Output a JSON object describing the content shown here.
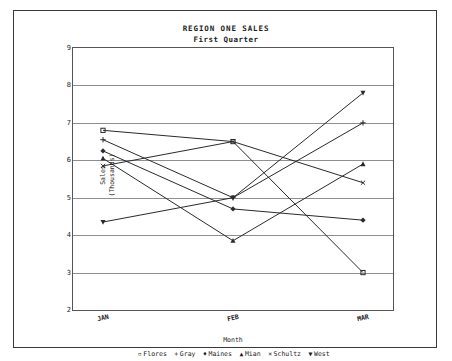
{
  "chart_data": {
    "type": "line",
    "title": "REGION ONE SALES",
    "subtitle": "First Quarter",
    "xlabel": "Month",
    "ylabel": "Sales\n(Thousands)",
    "ylabel_line1": "Sales",
    "ylabel_line2": "(Thousands)",
    "categories": [
      "JAN",
      "FEB",
      "MAR"
    ],
    "ylim": [
      2,
      9
    ],
    "yticks": [
      9,
      8,
      7,
      6,
      5,
      4,
      3,
      2
    ],
    "grid": true,
    "legend_position": "bottom",
    "series": [
      {
        "name": "Flores",
        "marker": "square-open",
        "marker_glyph": "▫",
        "values": [
          6.8,
          6.5,
          3.0
        ]
      },
      {
        "name": "Gray",
        "marker": "plus",
        "marker_glyph": "+",
        "values": [
          6.55,
          5.0,
          7.0
        ]
      },
      {
        "name": "Maines",
        "marker": "diamond",
        "marker_glyph": "♦",
        "values": [
          6.25,
          4.7,
          4.4
        ]
      },
      {
        "name": "Mian",
        "marker": "triangle-up",
        "marker_glyph": "▲",
        "values": [
          6.05,
          3.85,
          5.9
        ]
      },
      {
        "name": "Schultz",
        "marker": "cross",
        "marker_glyph": "×",
        "values": [
          5.85,
          6.5,
          5.4
        ]
      },
      {
        "name": "West",
        "marker": "triangle-down",
        "marker_glyph": "▼",
        "values": [
          4.35,
          5.0,
          7.8
        ]
      }
    ],
    "line_color": "#2a2a2a",
    "grid_color": "#8f8f8f",
    "axis_color": "#555555",
    "text_color": "#1c1c1c"
  }
}
